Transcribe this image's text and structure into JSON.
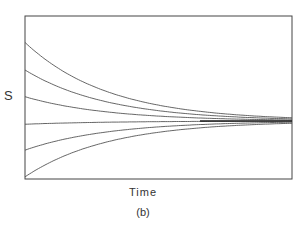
{
  "chart_data": {
    "type": "line",
    "title": "",
    "caption": "(b)",
    "xlabel": "Time",
    "ylabel": "S",
    "grid": false,
    "legend": null,
    "xlim": [
      0,
      1
    ],
    "ylim": [
      -1,
      1
    ],
    "equilibrium": 0,
    "decay_rate": 3.2,
    "x": [
      0,
      0.1,
      0.2,
      0.3,
      0.4,
      0.5,
      0.6,
      0.7,
      0.8,
      0.9,
      1.0
    ],
    "series": [
      {
        "name": "curve-1",
        "initial": 0.97,
        "values": [
          0.97,
          0.7,
          0.51,
          0.37,
          0.27,
          0.2,
          0.14,
          0.1,
          0.07,
          0.05,
          0.04
        ]
      },
      {
        "name": "curve-2",
        "initial": 0.63,
        "values": [
          0.63,
          0.46,
          0.33,
          0.24,
          0.18,
          0.13,
          0.09,
          0.07,
          0.05,
          0.03,
          0.03
        ]
      },
      {
        "name": "curve-3",
        "initial": 0.3,
        "values": [
          0.3,
          0.22,
          0.16,
          0.11,
          0.08,
          0.06,
          0.04,
          0.03,
          0.02,
          0.02,
          0.01
        ]
      },
      {
        "name": "curve-4",
        "initial": -0.04,
        "values": [
          -0.04,
          -0.03,
          -0.02,
          -0.02,
          -0.01,
          -0.01,
          -0.01,
          0.0,
          0.0,
          0.0,
          0.0
        ]
      },
      {
        "name": "curve-5",
        "initial": -0.36,
        "values": [
          -0.36,
          -0.26,
          -0.19,
          -0.14,
          -0.1,
          -0.07,
          -0.05,
          -0.04,
          -0.03,
          -0.02,
          -0.01
        ]
      },
      {
        "name": "curve-6",
        "initial": -0.69,
        "values": [
          -0.69,
          -0.5,
          -0.36,
          -0.26,
          -0.19,
          -0.14,
          -0.1,
          -0.07,
          -0.05,
          -0.04,
          -0.03
        ]
      }
    ],
    "style": {
      "line_color": "#555555",
      "axis_color": "#444444",
      "background": "#ffffff"
    },
    "plot_box_px": {
      "left": 25,
      "top": 16,
      "right": 292,
      "bottom": 179
    },
    "equilibrium_px_y": 121,
    "px_per_unit_y": 81
  }
}
